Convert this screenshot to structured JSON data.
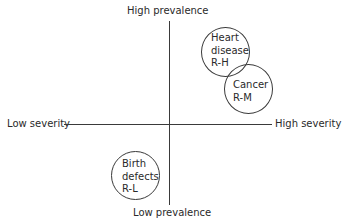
{
  "axes": {
    "top": "High prevalence",
    "bottom": "Low prevalence",
    "left": "Low severity",
    "right": "High severity"
  },
  "items": [
    {
      "name": "Heart disease",
      "lines": [
        "Heart",
        "disease",
        "R-H"
      ],
      "code": "R-H",
      "quadrant": "high prevalence / high severity"
    },
    {
      "name": "Cancer",
      "lines": [
        "Cancer",
        "R-M"
      ],
      "code": "R-M",
      "quadrant": "high prevalence / high severity"
    },
    {
      "name": "Birth defects",
      "lines": [
        "Birth",
        "defects",
        "R-L"
      ],
      "code": "R-L",
      "quadrant": "low prevalence / low severity"
    }
  ]
}
